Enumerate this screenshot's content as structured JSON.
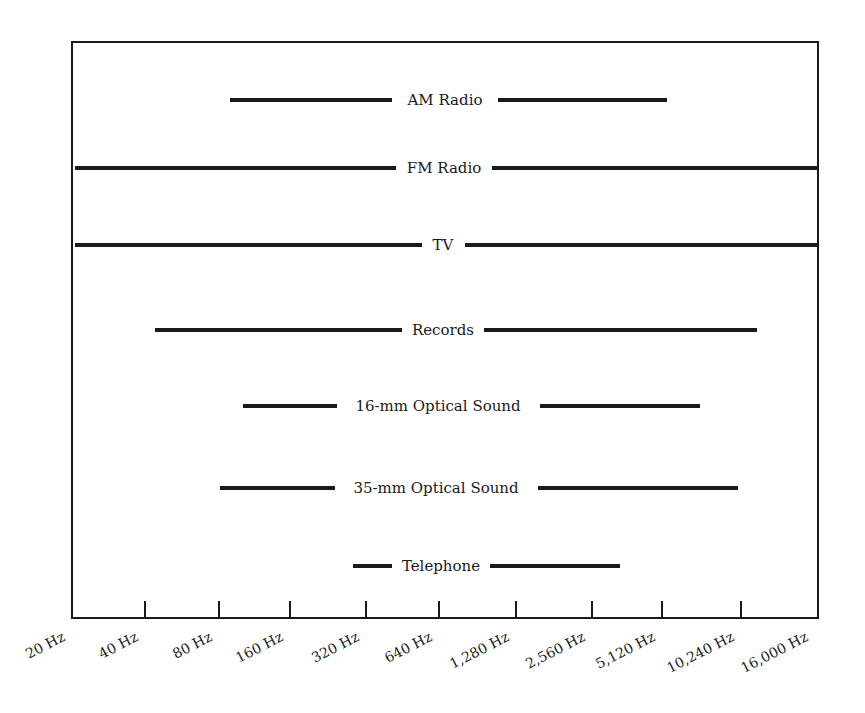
{
  "chart_data": {
    "type": "range-bar",
    "title": "",
    "xlabel": "",
    "ylabel": "",
    "x_scale": "log2",
    "x_ticks": [
      "20 Hz",
      "40 Hz",
      "80 Hz",
      "160 Hz",
      "320 Hz",
      "640 Hz",
      "1,280 Hz",
      "2,560 Hz",
      "5,120 Hz",
      "10,240 Hz",
      "16,000 Hz"
    ],
    "x_tick_values": [
      20,
      40,
      80,
      160,
      320,
      640,
      1280,
      2560,
      5120,
      10240,
      16000
    ],
    "xlim": [
      20,
      16000
    ],
    "grid": false,
    "legend": "none",
    "series": [
      {
        "name": "AM Radio",
        "low_hz": 90,
        "high_hz": 5000
      },
      {
        "name": "FM Radio",
        "low_hz": 20,
        "high_hz": 16000
      },
      {
        "name": "TV",
        "low_hz": 20,
        "high_hz": 16000
      },
      {
        "name": "Records",
        "low_hz": 44,
        "high_hz": 11500
      },
      {
        "name": "16-mm Optical Sound",
        "low_hz": 100,
        "high_hz": 7000
      },
      {
        "name": "35-mm Optical Sound",
        "low_hz": 80,
        "high_hz": 10000
      },
      {
        "name": "Telephone",
        "low_hz": 280,
        "high_hz": 3500
      }
    ]
  },
  "layout": {
    "frame": {
      "left": 72,
      "top": 42,
      "right": 818,
      "bottom": 618
    },
    "rows": [
      {
        "label": "AM Radio",
        "y": 100,
        "x1": 230,
        "x2": 667,
        "gap_left": 392,
        "gap_right": 498,
        "label_x": 445
      },
      {
        "label": "FM Radio",
        "y": 168,
        "x1": 75,
        "x2": 818,
        "gap_left": 396,
        "gap_right": 492,
        "label_x": 444
      },
      {
        "label": "TV",
        "y": 245,
        "x1": 75,
        "x2": 818,
        "gap_left": 422,
        "gap_right": 465,
        "label_x": 443
      },
      {
        "label": "Records",
        "y": 330,
        "x1": 155,
        "x2": 757,
        "gap_left": 402,
        "gap_right": 484,
        "label_x": 443
      },
      {
        "label": "16-mm Optical Sound",
        "y": 406,
        "x1": 243,
        "x2": 700,
        "gap_left": 337,
        "gap_right": 540,
        "label_x": 438
      },
      {
        "label": "35-mm Optical Sound",
        "y": 488,
        "x1": 220,
        "x2": 738,
        "gap_left": 335,
        "gap_right": 538,
        "label_x": 436
      },
      {
        "label": "Telephone",
        "y": 566,
        "x1": 353,
        "x2": 620,
        "gap_left": 392,
        "gap_right": 490,
        "label_x": 441
      }
    ],
    "ticks": [
      {
        "x": 72,
        "label": "20 Hz"
      },
      {
        "x": 145,
        "label": "40 Hz"
      },
      {
        "x": 219,
        "label": "80 Hz"
      },
      {
        "x": 290,
        "label": "160 Hz"
      },
      {
        "x": 366,
        "label": "320 Hz"
      },
      {
        "x": 439,
        "label": "640 Hz"
      },
      {
        "x": 516,
        "label": "1,280 Hz"
      },
      {
        "x": 592,
        "label": "2,560 Hz"
      },
      {
        "x": 662,
        "label": "5,120 Hz"
      },
      {
        "x": 741,
        "label": "10,240 Hz"
      },
      {
        "x": 815,
        "label": "16,000 Hz"
      }
    ],
    "colors": {
      "ink": "#1a1a1a",
      "background": "#ffffff"
    }
  }
}
